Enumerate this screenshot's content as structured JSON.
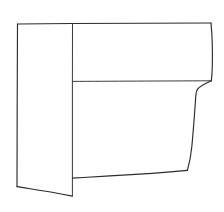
{
  "image": {
    "kind": "line-drawing",
    "subject": "hand-drawn outline sketch of a rectangular panel with a narrow left strip and a lower right panel with wavy edges",
    "style": "black ink contour line art on white background",
    "width": 224,
    "height": 212
  },
  "colors": {
    "background": "#ffffff",
    "fill": "#ffffff",
    "stroke": "#2b2b2b",
    "stroke_light": "#3a3a3a"
  },
  "geometry": {
    "top_edge": "M17.5,24 L72.5,23.5 L211,23",
    "left_edge": "M17.5,24 L17.2,100 L17.0,186.5",
    "left_bottom_edge": "M17.0,186.5 C32,189 52,192.5 72.4,196",
    "center_divider": "M72.5,23.5 L72.4,81.5 L72.4,140 L72.4,196",
    "mid_horizontal": "M72.4,81.4 C110,81.2 160,81.0 211,80.8",
    "right_upper_edge": "M211,23 C212.2,40 212.4,60 211.3,80.8",
    "right_lower_edge": "M211.3,80.8 C205,84 198.5,86.5 195.6,93.5 C193.8,110 192.2,130 190.5,150 C189.6,158 188.6,164 187.4,170.2",
    "right_bottom_edge": "M187.4,170.2 C170,172 150,173.6 130,175 C110,176.4 90,177.4 72.4,178.1"
  },
  "regions": [
    {
      "name": "upper-left-panel",
      "label": ""
    },
    {
      "name": "upper-right-panel",
      "label": ""
    },
    {
      "name": "left-strip-lower",
      "label": ""
    },
    {
      "name": "lower-right-panel",
      "label": ""
    }
  ]
}
